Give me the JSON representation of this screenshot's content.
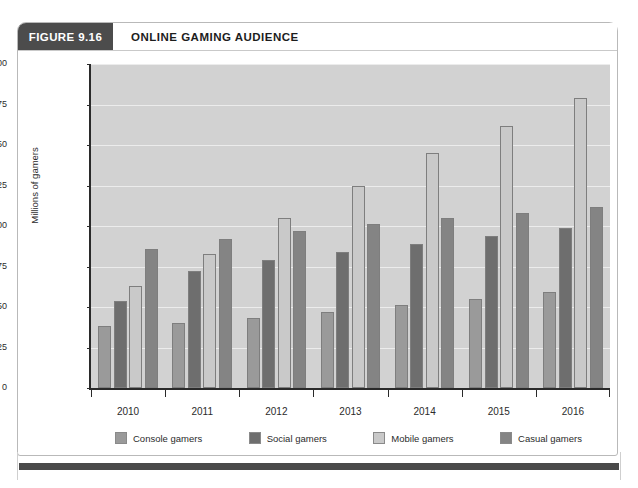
{
  "figure": {
    "tag": "FIGURE 9.16",
    "title": "ONLINE GAMING AUDIENCE"
  },
  "colors": {
    "tag_bg": "#4c4c4c",
    "plot_bg": "#d2d2d2",
    "gridline": "#ececec",
    "axis": "#2a2a2a",
    "console": "#9a9a9a",
    "social": "#6e6e6e",
    "mobile": "#c9c9c9",
    "casual": "#848484"
  },
  "chart_data": {
    "type": "bar",
    "title": "ONLINE GAMING AUDIENCE",
    "xlabel": "",
    "ylabel": "Millions of gamers",
    "categories": [
      "2010",
      "2011",
      "2012",
      "2013",
      "2014",
      "2015",
      "2016"
    ],
    "ylim": [
      0,
      200
    ],
    "yticks": [
      0,
      25,
      50,
      75,
      100,
      125,
      150,
      175,
      200
    ],
    "ytick_labels": [
      "0",
      "25",
      "50",
      "75",
      "100",
      "125",
      "150",
      "175",
      "200"
    ],
    "grid": true,
    "legend_position": "bottom",
    "series": [
      {
        "name": "Console gamers",
        "color": "#9a9a9a",
        "values": [
          38,
          40,
          43,
          47,
          51,
          55,
          59
        ]
      },
      {
        "name": "Social gamers",
        "color": "#6e6e6e",
        "values": [
          54,
          72,
          79,
          84,
          89,
          94,
          99
        ]
      },
      {
        "name": "Mobile gamers",
        "color": "#c9c9c9",
        "values": [
          63,
          83,
          105,
          125,
          145,
          162,
          179
        ]
      },
      {
        "name": "Casual gamers",
        "color": "#848484",
        "values": [
          86,
          92,
          97,
          101,
          105,
          108,
          112
        ]
      }
    ]
  }
}
